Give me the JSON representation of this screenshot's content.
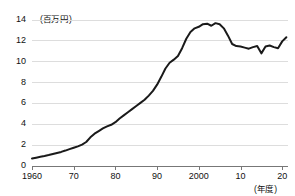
{
  "chart_data": {
    "type": "line",
    "title": "",
    "subtitle": "",
    "xlabel": "(年度)",
    "ylabel": "(百万円)",
    "unit_note": "(百万円)",
    "xaxis_unit_note": "(年度)",
    "grid": true,
    "legend": "none",
    "xlim": [
      1960,
      2021
    ],
    "ylim": [
      0,
      14
    ],
    "ytick_labels": [
      "0",
      "2",
      "4",
      "6",
      "8",
      "10",
      "12",
      "14"
    ],
    "yticks": [
      0,
      2,
      4,
      6,
      8,
      10,
      12,
      14
    ],
    "xtick_labels": [
      "1960",
      "70",
      "80",
      "90",
      "2000",
      "10",
      "20"
    ],
    "xticks": [
      1960,
      1970,
      1980,
      1990,
      2000,
      2010,
      2020
    ],
    "series": [
      {
        "name": "一世帯当たり平均所得金額",
        "color": "#1a1a1a",
        "x": [
          1960,
          1961,
          1962,
          1963,
          1964,
          1965,
          1966,
          1967,
          1968,
          1969,
          1970,
          1971,
          1972,
          1973,
          1974,
          1975,
          1976,
          1977,
          1978,
          1979,
          1980,
          1981,
          1982,
          1983,
          1984,
          1985,
          1986,
          1987,
          1988,
          1989,
          1990,
          1991,
          1992,
          1993,
          1994,
          1995,
          1996,
          1997,
          1998,
          1999,
          2000,
          2001,
          2002,
          2003,
          2004,
          2005,
          2006,
          2007,
          2008,
          2009,
          2010,
          2011,
          2012,
          2013,
          2014,
          2015,
          2016,
          2017,
          2018,
          2019,
          2020,
          2021
        ],
        "values": [
          0.72,
          0.8,
          0.88,
          0.96,
          1.05,
          1.15,
          1.25,
          1.35,
          1.48,
          1.62,
          1.75,
          1.88,
          2.05,
          2.3,
          2.75,
          3.1,
          3.35,
          3.6,
          3.8,
          3.95,
          4.2,
          4.55,
          4.85,
          5.15,
          5.45,
          5.75,
          6.05,
          6.35,
          6.75,
          7.2,
          7.8,
          8.55,
          9.35,
          9.9,
          10.2,
          10.55,
          11.3,
          12.2,
          12.85,
          13.2,
          13.35,
          13.6,
          13.65,
          13.45,
          13.7,
          13.6,
          13.2,
          12.5,
          11.7,
          11.5,
          11.45,
          11.35,
          11.25,
          11.4,
          11.5,
          10.8,
          11.45,
          11.55,
          11.4,
          11.3,
          11.95,
          12.35
        ]
      }
    ]
  },
  "axis": {
    "y_unit": "(百万円)",
    "x_unit": "(年度)"
  }
}
